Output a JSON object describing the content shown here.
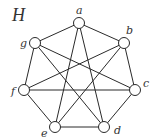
{
  "title": "H",
  "graph": {
    "vertices": [
      {
        "id": "a",
        "label": "a"
      },
      {
        "id": "b",
        "label": "b"
      },
      {
        "id": "c",
        "label": "c"
      },
      {
        "id": "d",
        "label": "d"
      },
      {
        "id": "e",
        "label": "e"
      },
      {
        "id": "f",
        "label": "f"
      },
      {
        "id": "g",
        "label": "g"
      }
    ],
    "edges": [
      [
        "a",
        "b"
      ],
      [
        "b",
        "c"
      ],
      [
        "c",
        "d"
      ],
      [
        "d",
        "e"
      ],
      [
        "e",
        "f"
      ],
      [
        "f",
        "g"
      ],
      [
        "g",
        "a"
      ],
      [
        "a",
        "d"
      ],
      [
        "a",
        "e"
      ],
      [
        "b",
        "e"
      ],
      [
        "b",
        "f"
      ],
      [
        "c",
        "f"
      ],
      [
        "c",
        "g"
      ],
      [
        "d",
        "g"
      ]
    ]
  },
  "colors": {
    "stroke": "#2a2a2a",
    "vertex_fill": "#ffffff",
    "text": "#333333"
  }
}
